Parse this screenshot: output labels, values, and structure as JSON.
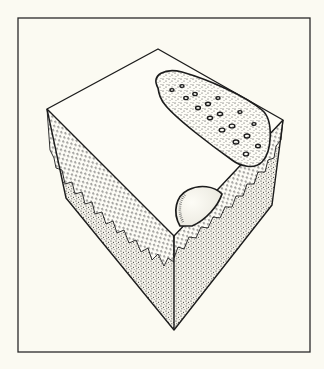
{
  "figure": {
    "kind": "block-diagram illustration",
    "colors": {
      "background": "#fbfaf2",
      "ink": "#1c1c1c",
      "face_fill": "#fdfcf6"
    },
    "frame": {
      "x": 18,
      "y": 18,
      "width": 292,
      "height": 334
    },
    "vertices": {
      "top": [
        158,
        49
      ],
      "left": [
        47,
        109
      ],
      "right": [
        283,
        120
      ],
      "front": [
        174,
        236
      ],
      "left_bottom": [
        66,
        198
      ],
      "right_bottom": [
        272,
        205
      ],
      "bottom": [
        174,
        330
      ]
    },
    "features": [
      {
        "name": "spotted-lobe",
        "label": ""
      },
      {
        "name": "dome",
        "label": ""
      },
      {
        "name": "jagged-upper-layer",
        "label": ""
      },
      {
        "name": "stippled-lower-layer",
        "label": ""
      }
    ]
  }
}
